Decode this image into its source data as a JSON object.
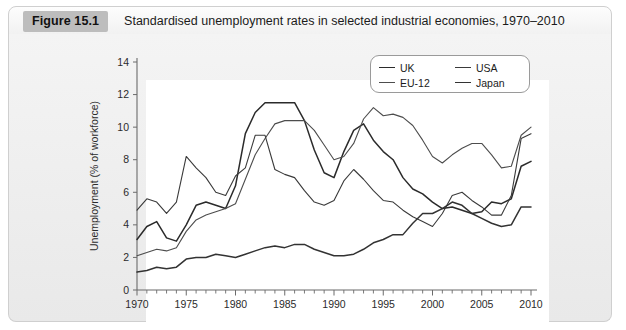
{
  "caption": {
    "figure_label": "Figure 15.1",
    "title": "Standardised unemployment rates in selected industrial economies, 1970–2010"
  },
  "chart_data": {
    "type": "line",
    "title": "Standardised unemployment rates in selected industrial economies, 1970–2010",
    "xlabel": "",
    "ylabel": "Unemployment (% of workforce)",
    "xlim": [
      1970,
      2010
    ],
    "ylim": [
      0,
      14
    ],
    "ytick_labels": [
      "0",
      "2",
      "4",
      "6",
      "8",
      "10",
      "12",
      "14"
    ],
    "yticks": [
      0,
      2,
      4,
      6,
      8,
      10,
      12,
      14
    ],
    "xtick_labels": [
      "1970",
      "1975",
      "1980",
      "1985",
      "1990",
      "1995",
      "2000",
      "2005",
      "2010"
    ],
    "xticks": [
      1970,
      1975,
      1980,
      1985,
      1990,
      1995,
      2000,
      2005,
      2010
    ],
    "minor_xtick_step": 1,
    "grid": false,
    "legend_position": "top-right",
    "x": [
      1970,
      1971,
      1972,
      1973,
      1974,
      1975,
      1976,
      1977,
      1978,
      1979,
      1980,
      1981,
      1982,
      1983,
      1984,
      1985,
      1986,
      1987,
      1988,
      1989,
      1990,
      1991,
      1992,
      1993,
      1994,
      1995,
      1996,
      1997,
      1998,
      1999,
      2000,
      2001,
      2002,
      2003,
      2004,
      2005,
      2006,
      2007,
      2008,
      2009,
      2010
    ],
    "series": [
      {
        "name": "UK",
        "color": "#2b2b2b",
        "values": [
          3.1,
          3.9,
          4.2,
          3.2,
          3.0,
          4.0,
          5.2,
          5.4,
          5.2,
          5.0,
          6.4,
          9.6,
          10.9,
          11.5,
          11.5,
          11.5,
          11.5,
          10.4,
          8.6,
          7.2,
          6.9,
          8.5,
          9.8,
          10.2,
          9.2,
          8.5,
          8.0,
          6.9,
          6.2,
          5.9,
          5.4,
          5.0,
          5.1,
          4.9,
          4.7,
          4.8,
          5.4,
          5.3,
          5.6,
          7.6,
          7.9
        ]
      },
      {
        "name": "EU-12",
        "color": "#4d4d4d",
        "values": [
          2.1,
          2.3,
          2.5,
          2.4,
          2.6,
          3.6,
          4.3,
          4.6,
          4.8,
          5.0,
          5.3,
          6.8,
          8.3,
          9.3,
          10.2,
          10.4,
          10.4,
          10.4,
          9.8,
          8.9,
          8.0,
          8.2,
          9.0,
          10.5,
          11.2,
          10.7,
          10.8,
          10.6,
          10.1,
          9.2,
          8.2,
          7.8,
          8.3,
          8.7,
          9.0,
          9.0,
          8.3,
          7.5,
          7.6,
          9.5,
          10.0
        ]
      },
      {
        "name": "USA",
        "color": "#3a3a3a",
        "values": [
          4.9,
          5.6,
          5.4,
          4.7,
          5.4,
          8.2,
          7.5,
          6.9,
          6.0,
          5.8,
          7.0,
          7.5,
          9.5,
          9.5,
          7.4,
          7.1,
          6.9,
          6.1,
          5.4,
          5.2,
          5.5,
          6.7,
          7.4,
          6.8,
          6.1,
          5.5,
          5.4,
          4.9,
          4.5,
          4.2,
          3.9,
          4.7,
          5.8,
          6.0,
          5.5,
          5.1,
          4.6,
          4.6,
          5.8,
          9.3,
          9.6
        ]
      },
      {
        "name": "Japan",
        "color": "#333333",
        "values": [
          1.1,
          1.2,
          1.4,
          1.3,
          1.4,
          1.9,
          2.0,
          2.0,
          2.2,
          2.1,
          2.0,
          2.2,
          2.4,
          2.6,
          2.7,
          2.6,
          2.8,
          2.8,
          2.5,
          2.3,
          2.1,
          2.1,
          2.2,
          2.5,
          2.9,
          3.1,
          3.4,
          3.4,
          4.1,
          4.7,
          4.7,
          5.0,
          5.4,
          5.2,
          4.7,
          4.4,
          4.1,
          3.9,
          4.0,
          5.1,
          5.1
        ]
      }
    ],
    "legend_entries": [
      {
        "label": "UK",
        "color": "#2b2b2b"
      },
      {
        "label": "USA",
        "color": "#3a3a3a"
      },
      {
        "label": "EU-12",
        "color": "#4d4d4d"
      },
      {
        "label": "Japan",
        "color": "#333333"
      }
    ]
  }
}
